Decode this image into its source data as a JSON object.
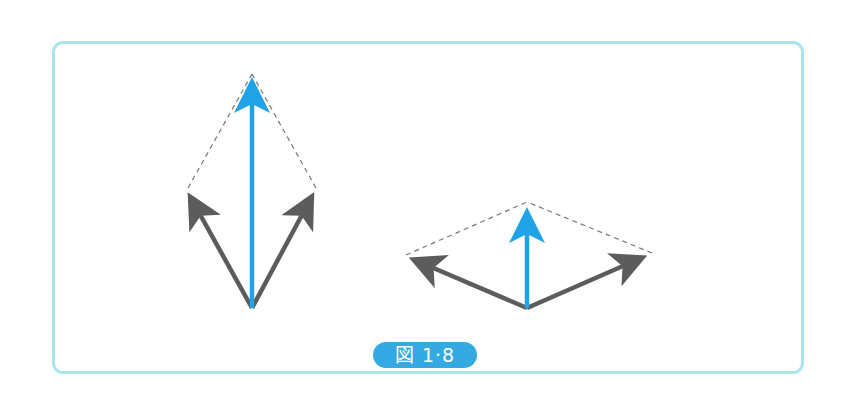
{
  "figure": {
    "label": "図 1·8",
    "colors": {
      "frame_border": "#a9e4ee",
      "resultant": "#1fa3e6",
      "component": "#5c5c5c",
      "guide_dashed": "#777777",
      "label_bg": "#35a9e2",
      "label_text": "#ffffff"
    },
    "diagrams": [
      {
        "name": "narrow-angle-composition",
        "origin": [
          252,
          308
        ],
        "resultant_tip": [
          252,
          72
        ],
        "components": [
          [
            186,
            190
          ],
          [
            316,
            190
          ]
        ]
      },
      {
        "name": "wide-angle-composition",
        "origin": [
          527,
          308
        ],
        "resultant_tip": [
          527,
          202
        ],
        "components": [
          [
            404,
            256
          ],
          [
            652,
            254
          ]
        ]
      }
    ]
  }
}
